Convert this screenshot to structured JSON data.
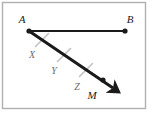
{
  "figure": {
    "kind": "geometry-diagram",
    "frame": {
      "border_color": "#b0b0b0",
      "background_color": "#ffffff",
      "x": 2.5,
      "y": 2.5,
      "width": 143,
      "height": 106
    },
    "colors": {
      "stroke": "#1a1a1a",
      "tick": "#c2c2c2",
      "label": "#1a1a1a",
      "tick_label": "#6b6b6b"
    },
    "points": [
      {
        "id": "A",
        "label": "A",
        "x": 29,
        "y": 31,
        "label_x": 22,
        "label_y": 23,
        "dot": true,
        "dot_r": 2.6
      },
      {
        "id": "B",
        "label": "B",
        "x": 125,
        "y": 31,
        "label_x": 128,
        "label_y": 23,
        "dot": true,
        "dot_r": 2.6
      },
      {
        "id": "M",
        "label": "M",
        "x": 103,
        "y": 80,
        "label_x": 89,
        "label_y": 98,
        "dot": true,
        "dot_r": 2.6
      }
    ],
    "segments": [
      {
        "id": "AB",
        "label": "segment-ab",
        "x1": 29,
        "y1": 31,
        "x2": 125,
        "y2": 31,
        "width": 2.0,
        "arrow": false
      }
    ],
    "rays": [
      {
        "id": "AM",
        "label": "ray-am",
        "x1": 29,
        "y1": 31,
        "x2": 117,
        "y2": 91,
        "width": 3.0,
        "arrow": true
      }
    ],
    "ticks": [
      {
        "id": "tick-x",
        "cx": 42,
        "cy": 40,
        "length": 13,
        "width": 1.6
      },
      {
        "id": "tick-y",
        "cx": 64,
        "cy": 55,
        "length": 13,
        "width": 1.6
      },
      {
        "id": "tick-z",
        "cx": 86,
        "cy": 70,
        "length": 13,
        "width": 1.6
      }
    ],
    "tick_labels": [
      {
        "id": "X",
        "label": "X",
        "x": 32,
        "y": 58
      },
      {
        "id": "Y",
        "label": "Y",
        "x": 54,
        "y": 73
      },
      {
        "id": "Z",
        "label": "Z",
        "x": 76,
        "y": 89
      }
    ],
    "label_font_size": 11,
    "tick_label_font_size": 10
  }
}
